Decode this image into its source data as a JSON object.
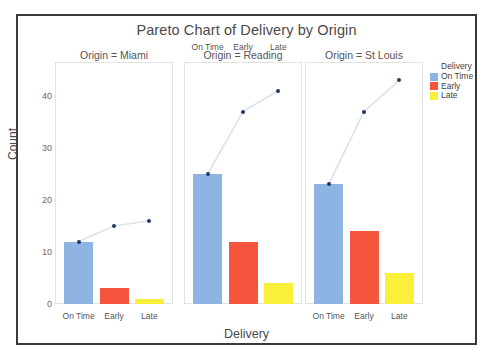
{
  "chart_data": {
    "type": "bar",
    "title": "Pareto Chart of Delivery by Origin",
    "xlabel": "Delivery",
    "ylabel": "Count",
    "categories": [
      "On Time",
      "Early",
      "Late"
    ],
    "facet_variable": "Origin",
    "ylim": [
      0,
      45
    ],
    "yticks": [
      0,
      10,
      20,
      30,
      40
    ],
    "ytick_labels": [
      "0",
      "10",
      "20",
      "30",
      "40"
    ],
    "grid": false,
    "legend_position": "right",
    "legend_title": "Delivery",
    "legend_entries": [
      {
        "label": "On Time",
        "color": "#8DB4E2"
      },
      {
        "label": "Early",
        "color": "#F4553C"
      },
      {
        "label": "Late",
        "color": "#FAF03C"
      }
    ],
    "panels": [
      {
        "strip_label": "Origin = Miami",
        "values": [
          12,
          3,
          1
        ],
        "cumulative": [
          12,
          15,
          16
        ],
        "show_bottom_ticks": true,
        "show_top_ticks": false
      },
      {
        "strip_label": "Origin = Reading",
        "values": [
          25,
          12,
          4
        ],
        "cumulative": [
          25,
          37,
          41
        ],
        "show_bottom_ticks": false,
        "show_top_ticks": true
      },
      {
        "strip_label": "Origin = St Louis",
        "values": [
          23,
          14,
          6
        ],
        "cumulative": [
          23,
          37,
          43
        ],
        "show_bottom_ticks": true,
        "show_top_ticks": false
      }
    ]
  },
  "colors": {
    "on_time": "#8DB4E2",
    "early": "#F4553C",
    "late": "#FAF03C",
    "line": "#DCE3EC",
    "marker": "#1F3A63",
    "frame": "#3a3a3a",
    "panel_border": "#e2e2e2",
    "text": "#4a4a4a"
  }
}
